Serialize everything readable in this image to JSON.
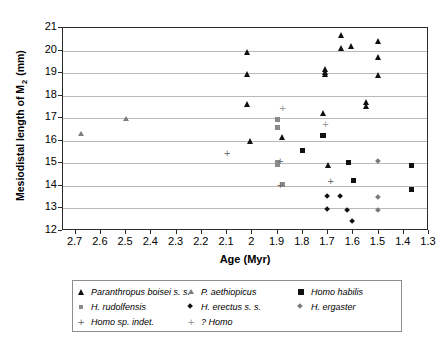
{
  "chart_data": {
    "type": "scatter",
    "title": "",
    "xlabel": "Age (Myr)",
    "ylabel": "Mesiodistal length of M 2 (mm)",
    "ylabel_main": "Mesiodistal length of M",
    "ylabel_sub": "2",
    "ylabel_unit": " (mm)",
    "xlim": [
      2.75,
      1.3
    ],
    "ylim": [
      12,
      21
    ],
    "x_reversed": true,
    "xticks": [
      "2.7",
      "2.6",
      "2.5",
      "2.4",
      "2.3",
      "2.2",
      "2.1",
      "2",
      "1.9",
      "1.8",
      "1.7",
      "1.6",
      "1.5",
      "1.4",
      "1.3"
    ],
    "xtick_values": [
      2.7,
      2.6,
      2.5,
      2.4,
      2.3,
      2.2,
      2.1,
      2.0,
      1.9,
      1.8,
      1.7,
      1.6,
      1.5,
      1.4,
      1.3
    ],
    "yticks": [
      "12",
      "13",
      "14",
      "15",
      "16",
      "17",
      "18",
      "19",
      "20",
      "21"
    ],
    "ytick_values": [
      12,
      13,
      14,
      15,
      16,
      17,
      18,
      19,
      20,
      21
    ],
    "grid": "horizontal",
    "legend_position": "below-plot",
    "series": [
      {
        "name": "Paranthropus boisei s. s.",
        "marker": "triangle",
        "color": "#111111",
        "points": [
          [
            2.02,
            19.95
          ],
          [
            2.02,
            18.95
          ],
          [
            2.02,
            17.63
          ],
          [
            2.01,
            15.97
          ],
          [
            1.88,
            16.14
          ],
          [
            1.72,
            17.22
          ],
          [
            1.71,
            19.18
          ],
          [
            1.71,
            19.05
          ],
          [
            1.71,
            18.95
          ],
          [
            1.7,
            14.92
          ],
          [
            1.65,
            20.7
          ],
          [
            1.65,
            20.1
          ],
          [
            1.61,
            20.18
          ],
          [
            1.55,
            17.72
          ],
          [
            1.55,
            17.55
          ],
          [
            1.5,
            20.42
          ],
          [
            1.5,
            19.72
          ],
          [
            1.5,
            18.93
          ]
        ]
      },
      {
        "name": "P. aethiopicus",
        "marker": "triangle-light",
        "color": "#7d7d7d",
        "points": [
          [
            2.68,
            16.3
          ],
          [
            2.5,
            16.95
          ]
        ]
      },
      {
        "name": "Homo habilis",
        "marker": "square",
        "color": "#111111",
        "points": [
          [
            1.8,
            15.55
          ],
          [
            1.72,
            16.25
          ],
          [
            1.62,
            15.02
          ],
          [
            1.37,
            14.92
          ],
          [
            1.37,
            13.83
          ],
          [
            1.6,
            14.22
          ]
        ]
      },
      {
        "name": "H. rudolfensis",
        "marker": "square-light",
        "color": "#8a8a8a",
        "points": [
          [
            1.9,
            16.95
          ],
          [
            1.9,
            16.58
          ],
          [
            1.9,
            14.95
          ],
          [
            1.9,
            15.05
          ],
          [
            1.88,
            14.08
          ]
        ]
      },
      {
        "name": "H. erectus s. s.",
        "marker": "diamond",
        "color": "#111111",
        "points": [
          [
            1.7,
            13.52
          ],
          [
            1.7,
            12.93
          ],
          [
            1.62,
            12.88
          ],
          [
            1.6,
            12.42
          ],
          [
            1.65,
            13.5
          ]
        ]
      },
      {
        "name": "H. ergaster",
        "marker": "diamond-light",
        "color": "#7a7a7a",
        "points": [
          [
            1.5,
            15.1
          ],
          [
            1.5,
            13.5
          ],
          [
            1.5,
            12.92
          ]
        ]
      },
      {
        "name": "Homo sp. indet.",
        "marker": "plus",
        "color": "#6f6f6f",
        "points": [
          [
            2.1,
            15.45
          ],
          [
            1.89,
            15.12
          ],
          [
            1.89,
            14.02
          ],
          [
            1.69,
            14.22
          ]
        ]
      },
      {
        "name": "? Homo",
        "marker": "plus-light",
        "color": "#9a9a9a",
        "points": [
          [
            1.88,
            17.45
          ],
          [
            1.71,
            16.75
          ]
        ]
      }
    ]
  },
  "legend": {
    "rows": [
      [
        {
          "label": "Paranthropus boisei s. s.",
          "marker": "triangle"
        },
        {
          "label": "P. aethiopicus",
          "marker": "triangle-light"
        },
        {
          "label": "Homo habilis",
          "marker": "square"
        }
      ],
      [
        {
          "label": "H. rudolfensis",
          "marker": "square-light"
        },
        {
          "label": "H. erectus s. s.",
          "marker": "diamond"
        },
        {
          "label": "H. ergaster",
          "marker": "diamond-light"
        }
      ],
      [
        {
          "label": "Homo sp. indet.",
          "marker": "plus"
        },
        {
          "label": "? Homo",
          "marker": "plus-light"
        }
      ]
    ]
  }
}
